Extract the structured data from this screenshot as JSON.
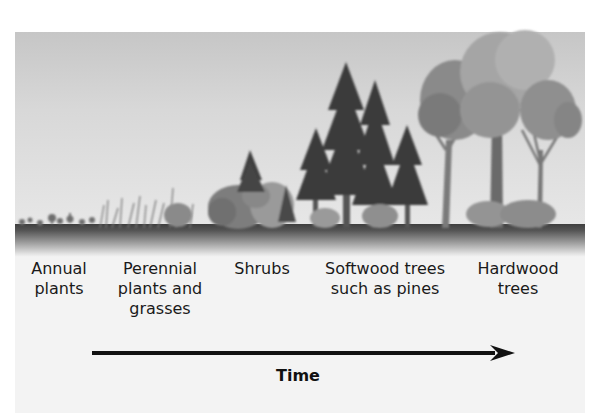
{
  "figure": {
    "stages": [
      {
        "id": "annual",
        "label_lines": [
          "Annual",
          "plants"
        ]
      },
      {
        "id": "perennial",
        "label_lines": [
          "Perennial",
          "plants and",
          "grasses"
        ]
      },
      {
        "id": "shrubs",
        "label_lines": [
          "Shrubs"
        ]
      },
      {
        "id": "softwood",
        "label_lines": [
          "Softwood trees",
          "such as pines"
        ]
      },
      {
        "id": "hardwood",
        "label_lines": [
          "Hardwood",
          "trees"
        ]
      }
    ],
    "axis": {
      "label": "Time",
      "direction": "left-to-right"
    },
    "colors": {
      "sky": "#d4d4d4",
      "ground": "#444444",
      "foliage_dark": "#3a3a3a",
      "foliage_mid": "#7a7a7a",
      "foliage_light": "#a8a8a8",
      "text": "#1a1a1a"
    }
  }
}
